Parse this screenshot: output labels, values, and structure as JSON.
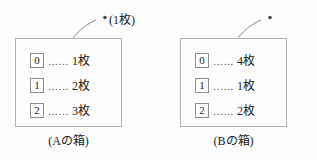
{
  "figure": {
    "groups": [
      {
        "id": "a",
        "caption": "(Aの箱)",
        "callout": "(1枚)",
        "rows": [
          {
            "digit": "0",
            "leader": "……",
            "count": "1枚"
          },
          {
            "digit": "1",
            "leader": "……",
            "count": "2枚"
          },
          {
            "digit": "2",
            "leader": "……",
            "count": "3枚"
          }
        ]
      },
      {
        "id": "b",
        "caption": "(Bの箱)",
        "callout": "(2枚)",
        "rows": [
          {
            "digit": "0",
            "leader": "……",
            "count": "4枚"
          },
          {
            "digit": "1",
            "leader": "……",
            "count": "1枚"
          },
          {
            "digit": "2",
            "leader": "……",
            "count": "2枚"
          }
        ]
      }
    ],
    "colors": {
      "box_border": "#b4b4b4",
      "digit_border": "#8e8e8e",
      "leader_line": "#7a7a7a",
      "text": "#222222",
      "background": "#fdfdfd"
    }
  }
}
